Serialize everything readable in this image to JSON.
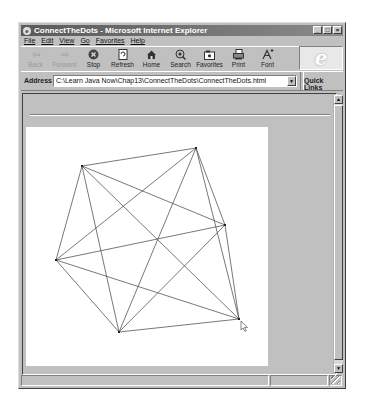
{
  "window": {
    "title": "ConnectTheDots - Microsoft Internet Explorer",
    "controls": {
      "minimize": "_",
      "maximize": "□",
      "close": "×"
    }
  },
  "menu": [
    "File",
    "Edit",
    "View",
    "Go",
    "Favorites",
    "Help"
  ],
  "toolbar": {
    "buttons": [
      {
        "label": "Back",
        "icon": "⇦",
        "enabled": false
      },
      {
        "label": "Forward",
        "icon": "⇨",
        "enabled": false
      },
      {
        "label": "Stop",
        "icon": "✖",
        "enabled": true
      },
      {
        "label": "Refresh",
        "icon": "↻",
        "enabled": true
      },
      {
        "label": "Home",
        "icon": "⌂",
        "enabled": true
      },
      {
        "label": "Search",
        "icon": "◎",
        "enabled": true
      },
      {
        "label": "Favorites",
        "icon": "▣",
        "enabled": true
      },
      {
        "label": "Print",
        "icon": "⎙",
        "enabled": true
      },
      {
        "label": "Font",
        "icon": "A",
        "enabled": true
      }
    ],
    "logo": "e"
  },
  "address": {
    "label": "Address",
    "value": "C:\\Learn Java Now\\Chap13\\ConnectTheDots\\ConnectTheDots.html",
    "dropdown_icon": "▼",
    "quick_links": "Quick Links"
  },
  "applet": {
    "background": "#ffffff",
    "line_color": "#555555",
    "dots": [
      {
        "id": "A",
        "x": 56,
        "y": 39
      },
      {
        "id": "B",
        "x": 170,
        "y": 21
      },
      {
        "id": "C",
        "x": 199,
        "y": 98
      },
      {
        "id": "D",
        "x": 213,
        "y": 192
      },
      {
        "id": "E",
        "x": 93,
        "y": 205
      },
      {
        "id": "F",
        "x": 30,
        "y": 133
      }
    ],
    "cursor": {
      "x": 215,
      "y": 194
    }
  },
  "scrollbar": {
    "up": "▲",
    "down": "▼"
  },
  "status": {
    "text": ""
  }
}
